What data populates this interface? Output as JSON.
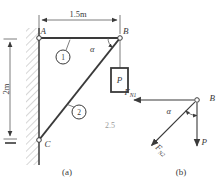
{
  "part_a": {
    "caption": "(a)",
    "label_A": "A",
    "label_B": "B",
    "label_C": "C",
    "member1_tag": "1",
    "member2_tag": "2",
    "alpha": "α",
    "weight": "P",
    "dim_width": "1.5m",
    "dim_height": "2m",
    "note": "2.5"
  },
  "part_b": {
    "caption": "(b)",
    "label_B": "B",
    "force1_symbol": "F",
    "force1_sub": "N1",
    "force2_symbol": "F",
    "force2_sub": "N2",
    "weight": "P",
    "alpha": "α"
  },
  "colors": {
    "ink": "#3a3a3a",
    "dim": "#5a5a5a",
    "faint": "#9a9a9a",
    "hatch": "#8a8a8a"
  }
}
